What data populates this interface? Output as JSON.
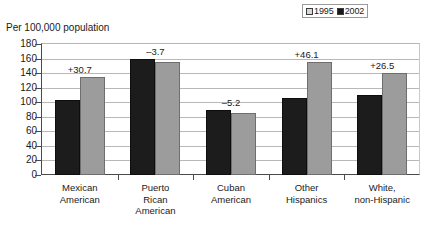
{
  "chart_data": {
    "type": "bar",
    "title": "Per 100,000 population",
    "xlabel": "",
    "ylabel": "Per 100,000 population",
    "ylim": [
      0,
      180
    ],
    "ytick_step": 20,
    "ytick_labels": [
      "180",
      "160",
      "140",
      "120",
      "100",
      "80",
      "60",
      "40",
      "20",
      "0"
    ],
    "grid": true,
    "legend_position": "top-right",
    "categories": [
      "Mexican American",
      "Puerto Rican American",
      "Cuban American",
      "Other Hispanics",
      "White, non-Hispanic"
    ],
    "category_lines": [
      [
        "Mexican",
        "American"
      ],
      [
        "Puerto",
        "Rican",
        "American"
      ],
      [
        "Cuban",
        "American"
      ],
      [
        "Other",
        "Hispanics"
      ],
      [
        "White,",
        "non-Hispanic"
      ]
    ],
    "series": [
      {
        "name": "2002",
        "color": "#1c1c1c",
        "values": [
          103,
          160,
          90,
          106,
          110
        ]
      },
      {
        "name": "1995",
        "color": "#9c9c9c",
        "values": [
          135,
          155,
          85,
          155,
          140
        ]
      }
    ],
    "annotations": [
      "+30.7",
      "–3.7",
      "–5.2",
      "+46.1",
      "+26.5"
    ]
  },
  "legend": {
    "entries": [
      {
        "label": "1995",
        "swatch": "series-1995"
      },
      {
        "label": "2002",
        "swatch": "series-2002"
      }
    ]
  }
}
